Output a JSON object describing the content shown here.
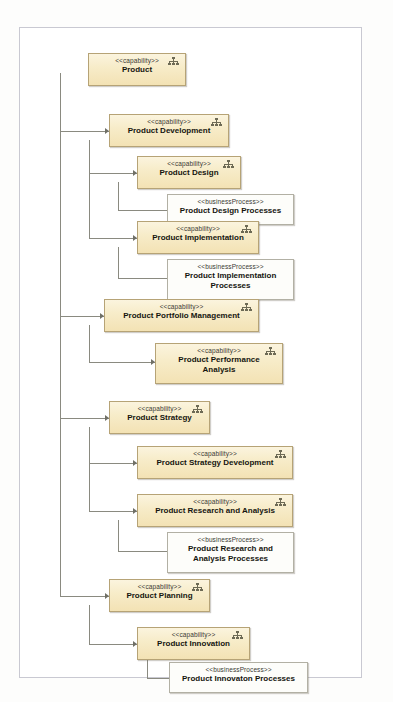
{
  "diagram": {
    "frame": {
      "border_color": "#c9c9d2",
      "background": "#ffffff"
    },
    "colors": {
      "capability_fill_top": "#fbf4de",
      "capability_fill_bottom": "#f3e2b4",
      "capability_border": "#b6a376",
      "process_fill": "#fdfdfa",
      "process_border": "#b2b0a4",
      "connector": "#8a8a80",
      "text": "#15150f"
    },
    "stereotypes": {
      "capability": "<<capability>>",
      "business_process": "<<businessProcess>>"
    },
    "icon": "hierarchy-tree-icon",
    "nodes": [
      {
        "id": "product",
        "stereotype": "<<capability>>",
        "name": "Product",
        "kind": "capability",
        "level": 0
      },
      {
        "id": "product-development",
        "stereotype": "<<capability>>",
        "name": "Product Development",
        "kind": "capability",
        "level": 1
      },
      {
        "id": "product-design",
        "stereotype": "<<capability>>",
        "name": "Product Design",
        "kind": "capability",
        "level": 2
      },
      {
        "id": "product-design-processes",
        "stereotype": "<<businessProcess>>",
        "name": "Product Design Processes",
        "kind": "process",
        "level": 3
      },
      {
        "id": "product-implementation",
        "stereotype": "<<capability>>",
        "name": "Product Implementation",
        "kind": "capability",
        "level": 2
      },
      {
        "id": "product-implementation-processes",
        "stereotype": "<<businessProcess>>",
        "name_line1": "Product Implementation",
        "name_line2": "Processes",
        "kind": "process",
        "level": 3
      },
      {
        "id": "product-portfolio-management",
        "stereotype": "<<capability>>",
        "name": "Product Portfolio Management",
        "kind": "capability",
        "level": 1
      },
      {
        "id": "product-performance-analysis",
        "stereotype": "<<capability>>",
        "name_line1": "Product Performance",
        "name_line2": "Analysis",
        "kind": "capability",
        "level": 2
      },
      {
        "id": "product-strategy",
        "stereotype": "<<capability>>",
        "name": "Product Strategy",
        "kind": "capability",
        "level": 1
      },
      {
        "id": "product-strategy-development",
        "stereotype": "<<capability>>",
        "name": "Product Strategy Development",
        "kind": "capability",
        "level": 2
      },
      {
        "id": "product-research-and-analysis",
        "stereotype": "<<capability>>",
        "name": "Product Research and Analysis",
        "kind": "capability",
        "level": 2
      },
      {
        "id": "product-research-and-analysis-processes",
        "stereotype": "<<businessProcess>>",
        "name_line1": "Product Research and",
        "name_line2": "Analysis Processes",
        "kind": "process",
        "level": 3
      },
      {
        "id": "product-planning",
        "stereotype": "<<capability>>",
        "name": "Product Planning",
        "kind": "capability",
        "level": 1
      },
      {
        "id": "product-innovation",
        "stereotype": "<<capability>>",
        "name": "Product Innovation",
        "kind": "capability",
        "level": 2
      },
      {
        "id": "product-innovation-processes",
        "stereotype": "<<businessProcess>>",
        "name": "Product Innovaton Processes",
        "kind": "process",
        "level": 3
      }
    ],
    "edges": [
      {
        "from": "product",
        "to": "product-development"
      },
      {
        "from": "product",
        "to": "product-portfolio-management"
      },
      {
        "from": "product",
        "to": "product-strategy"
      },
      {
        "from": "product",
        "to": "product-planning"
      },
      {
        "from": "product-development",
        "to": "product-design"
      },
      {
        "from": "product-development",
        "to": "product-implementation"
      },
      {
        "from": "product-design",
        "to": "product-design-processes"
      },
      {
        "from": "product-implementation",
        "to": "product-implementation-processes"
      },
      {
        "from": "product-portfolio-management",
        "to": "product-performance-analysis"
      },
      {
        "from": "product-strategy",
        "to": "product-strategy-development"
      },
      {
        "from": "product-strategy",
        "to": "product-research-and-analysis"
      },
      {
        "from": "product-research-and-analysis",
        "to": "product-research-and-analysis-processes"
      },
      {
        "from": "product-planning",
        "to": "product-innovation"
      },
      {
        "from": "product-innovation",
        "to": "product-innovation-processes"
      }
    ]
  }
}
